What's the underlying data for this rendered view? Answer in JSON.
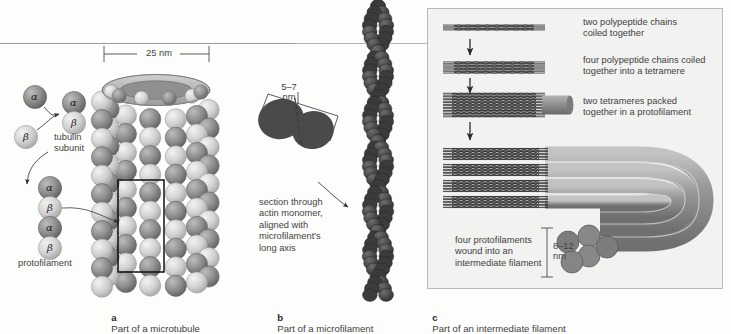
{
  "figure": {
    "title_rule": true,
    "background_color": "#fdfdfb",
    "ink_color": "#3f3f3f"
  },
  "panel_a": {
    "id": "a",
    "caption": "Part of a microtubule",
    "dimension_label": "25 nm",
    "labels": {
      "tubulin_subunit": "tubulin\nsubunit",
      "protofilament": "protofilament"
    },
    "monomers": {
      "alpha": "α",
      "beta": "β",
      "alpha_color": "#8a8a8a",
      "beta_color": "#c9c9c9"
    },
    "protofilament_sequence": [
      "α",
      "β",
      "α",
      "β"
    ],
    "microtubule": {
      "columns": 13,
      "rows": 11,
      "highlight_rect": true
    }
  },
  "panel_b": {
    "id": "b",
    "caption": "Part of a microfilament",
    "dimension_label": "5–7\nnm",
    "dimension_value": "5–7 nm",
    "note": "section through\nactin monomer,\naligned with\nmicrofilament's\nlong axis",
    "monomer_color": "#4a4a4a",
    "bead_count": 46
  },
  "panel_c": {
    "id": "c",
    "caption": "Part of an intermediate filament",
    "box_fill": "#f2f2f0",
    "box_border": "#b9b9b7",
    "steps": [
      {
        "index": 1,
        "text": "two polypeptide chains\ncoiled together",
        "strands": 2
      },
      {
        "index": 2,
        "text": "four polypeptide chains coiled\ntogether into a tetramere",
        "strands": 4
      },
      {
        "index": 3,
        "text": "two tetrameres packed\ntogether in a protofilament",
        "strands": 8
      },
      {
        "index": 4,
        "text": "four protofilaments\nwound into an\nintermediate filament",
        "strands": 4
      }
    ],
    "dimension_label": "8–12\nnm",
    "dimension_value": "8–12 nm",
    "rope_color": "#8e8e8e",
    "rope_count": 4
  }
}
